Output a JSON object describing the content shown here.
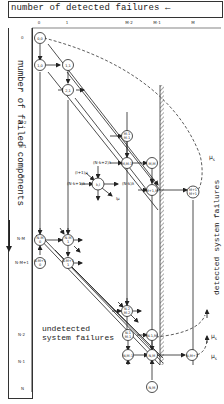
{
  "diagram": {
    "title_top": "number of detected failures",
    "title_left": "number of failed components",
    "title_right": "detected system failures",
    "undetected_label_line1": "undetected",
    "undetected_label_line2": "system failures",
    "column_labels": [
      "0",
      "1",
      "M-2",
      "M-1",
      "M"
    ],
    "row_labels_top": [
      "0",
      "1",
      "2",
      "M-2",
      "M-1",
      "M"
    ],
    "row_labels_bottom": [
      "N-M",
      "N-M+1",
      "N-2",
      "N-1",
      "N"
    ],
    "generic_node": {
      "label": "k,l",
      "in_left": "(N-k+1)λ",
      "in_upper_left": "(l+1)μ",
      "in_top": "(N-k+2)λ",
      "out_right": "(N-k)λ",
      "out_lower_right": "lμ"
    },
    "rate_labels": [
      "μ_s",
      "μ_s",
      "μ_s"
    ],
    "nodes": [
      {
        "id": "0,0",
        "label": "0,0"
      },
      {
        "id": "1,0",
        "label": "1,0"
      },
      {
        "id": "1,1",
        "label": "1,1"
      },
      {
        "id": "2,1",
        "label": "2,1"
      },
      {
        "id": "M-1,M-1",
        "label": "M-1 M-1"
      },
      {
        "id": "M,M-1",
        "label": "M,M-1"
      },
      {
        "id": "M,M",
        "label": "M,M"
      },
      {
        "id": "M+1,M",
        "label": "M+1,M"
      },
      {
        "id": "M+1,M+1",
        "label": "M+1 M+1"
      },
      {
        "id": "N-M,0",
        "label": "N-M 0"
      },
      {
        "id": "N-M,1",
        "label": "N-M 1"
      },
      {
        "id": "N-M+1,0",
        "label": "N-M+1 0"
      },
      {
        "id": "N-M+1,1",
        "label": "N-M+1 1"
      },
      {
        "id": "N-1,M-1",
        "label": "N-1 M-1"
      },
      {
        "id": "N-1,M",
        "label": "N-1,M"
      },
      {
        "id": "N,M-1",
        "label": "N,M-1"
      },
      {
        "id": "N,M",
        "label": "N,M"
      },
      {
        "id": "N,M+1",
        "label": "N,M+1"
      },
      {
        "id": "N-2,M-2",
        "label": "N-2 M-2"
      }
    ]
  }
}
